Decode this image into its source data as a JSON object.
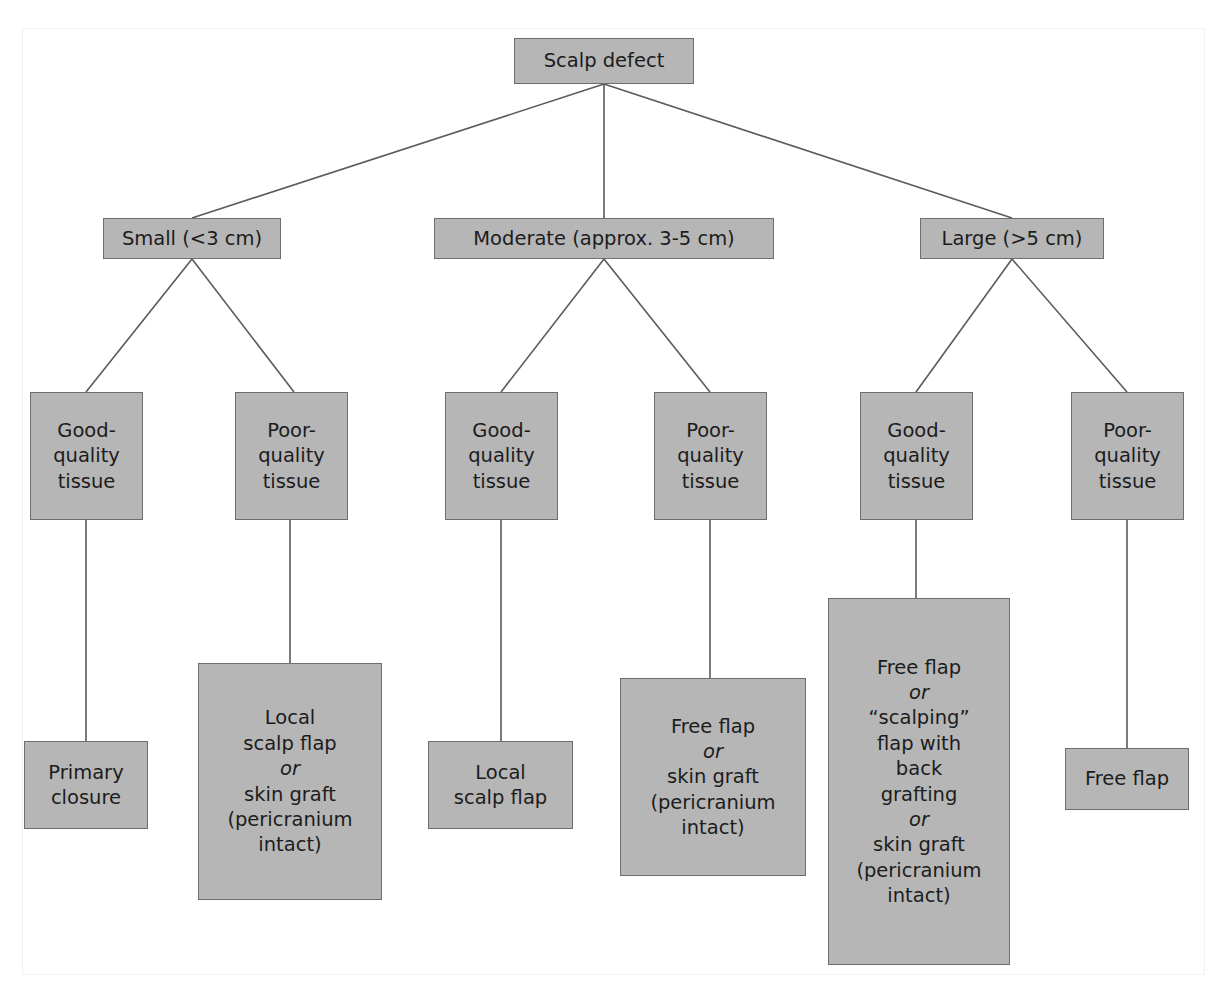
{
  "figure": {
    "box_fill": "#b6b6b6",
    "box_border": "#6e6e6e",
    "line_color": "#5a5a5a",
    "text_color": "#1c1c1c",
    "background": "#ffffff"
  },
  "nodes": {
    "root": {
      "label": "Scalp defect"
    },
    "level2": [
      {
        "id": "small",
        "label": "Small (<3 cm)"
      },
      {
        "id": "moderate",
        "label": "Moderate (approx. 3-5 cm)"
      },
      {
        "id": "large",
        "label": "Large (>5 cm)"
      }
    ],
    "tissue": [
      {
        "id": "small-good",
        "label": "Good-\nquality\ntissue"
      },
      {
        "id": "small-poor",
        "label": "Poor-\nquality\ntissue"
      },
      {
        "id": "moderate-good",
        "label": "Good-\nquality\ntissue"
      },
      {
        "id": "moderate-poor",
        "label": "Poor-\nquality\ntissue"
      },
      {
        "id": "large-good",
        "label": "Good-\nquality\ntissue"
      },
      {
        "id": "large-poor",
        "label": "Poor-\nquality\ntissue"
      }
    ],
    "leaves": [
      {
        "id": "small-good-leaf",
        "lines": [
          {
            "text": "Primary",
            "italic": false
          },
          {
            "text": "closure",
            "italic": false
          }
        ]
      },
      {
        "id": "small-poor-leaf",
        "lines": [
          {
            "text": "Local",
            "italic": false
          },
          {
            "text": "scalp flap",
            "italic": false
          },
          {
            "text": "or",
            "italic": true
          },
          {
            "text": "skin graft",
            "italic": false
          },
          {
            "text": "(pericranium",
            "italic": false
          },
          {
            "text": "intact)",
            "italic": false
          }
        ]
      },
      {
        "id": "moderate-good-leaf",
        "lines": [
          {
            "text": "Local",
            "italic": false
          },
          {
            "text": "scalp flap",
            "italic": false
          }
        ]
      },
      {
        "id": "moderate-poor-leaf",
        "lines": [
          {
            "text": "Free flap",
            "italic": false
          },
          {
            "text": "or",
            "italic": true
          },
          {
            "text": "skin graft",
            "italic": false
          },
          {
            "text": "(pericranium",
            "italic": false
          },
          {
            "text": "intact)",
            "italic": false
          }
        ]
      },
      {
        "id": "large-good-leaf",
        "lines": [
          {
            "text": "Free flap",
            "italic": false
          },
          {
            "text": "or",
            "italic": true
          },
          {
            "text": "“scalping”",
            "italic": false
          },
          {
            "text": "flap with",
            "italic": false
          },
          {
            "text": "back",
            "italic": false
          },
          {
            "text": "grafting",
            "italic": false
          },
          {
            "text": "or",
            "italic": true
          },
          {
            "text": "skin graft",
            "italic": false
          },
          {
            "text": "(pericranium",
            "italic": false
          },
          {
            "text": "intact)",
            "italic": false
          }
        ]
      },
      {
        "id": "large-poor-leaf",
        "lines": [
          {
            "text": "Free flap",
            "italic": false
          }
        ]
      }
    ]
  }
}
